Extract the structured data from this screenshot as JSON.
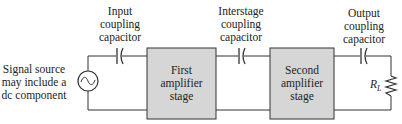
{
  "labels": {
    "source_lines": [
      "Signal source",
      "may include a",
      "dc component"
    ],
    "input_cap_lines": [
      "Input",
      "coupling",
      "capacitor"
    ],
    "interstage_cap_lines": [
      "Interstage",
      "coupling",
      "capacitor"
    ],
    "output_cap_lines": [
      "Output",
      "coupling",
      "capacitor"
    ],
    "stage1_lines": [
      "First",
      "amplifier",
      "stage"
    ],
    "stage2_lines": [
      "Second",
      "amplifier",
      "stage"
    ],
    "load_main": "R",
    "load_sub": "L"
  },
  "colors": {
    "box_fill": "#d6d6d6",
    "line": "#333333",
    "text": "#222222"
  }
}
